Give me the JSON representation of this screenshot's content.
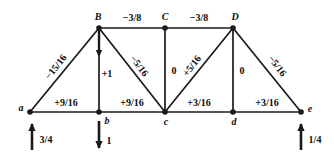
{
  "figure": {
    "type": "truss-force-diagram",
    "line_color": "#1a1a1a",
    "text_color": "#0d0d0d"
  },
  "nodes": [
    {
      "id": "a",
      "label": "a",
      "x": 30,
      "y": 112,
      "label_dx": -9,
      "label_dy": -4
    },
    {
      "id": "b",
      "label": "b",
      "x": 99,
      "y": 112,
      "label_dx": 8,
      "label_dy": 9
    },
    {
      "id": "c",
      "label": "c",
      "x": 165,
      "y": 112,
      "label_dx": 1,
      "label_dy": 10
    },
    {
      "id": "d",
      "label": "d",
      "x": 233,
      "y": 112,
      "label_dx": 1,
      "label_dy": 10
    },
    {
      "id": "e",
      "label": "e",
      "x": 301,
      "y": 112,
      "label_dx": 9,
      "label_dy": -3
    },
    {
      "id": "B",
      "label": "B",
      "x": 99,
      "y": 28,
      "label_dx": -1,
      "label_dy": -11
    },
    {
      "id": "C",
      "label": "C",
      "x": 165,
      "y": 28,
      "label_dx": 0,
      "label_dy": -11
    },
    {
      "id": "D",
      "label": "D",
      "x": 233,
      "y": 28,
      "label_dx": 2,
      "label_dy": -11
    }
  ],
  "members": [
    {
      "id": "a-B",
      "from": "a",
      "to": "B",
      "force": "−15/16",
      "label_x": 56,
      "label_y": 67,
      "rotate": -52
    },
    {
      "id": "a-b",
      "from": "a",
      "to": "b",
      "force": "+9/16",
      "label_x": 66,
      "label_y": 103,
      "rotate": 0
    },
    {
      "id": "b-B",
      "from": "b",
      "to": "B",
      "force": "+1",
      "label_x": 107,
      "label_y": 74,
      "rotate": 0
    },
    {
      "id": "B-C",
      "from": "B",
      "to": "C",
      "force": "−3/8",
      "label_x": 132,
      "label_y": 18,
      "rotate": 0
    },
    {
      "id": "B-c",
      "from": "B",
      "to": "c",
      "force": "−5/16",
      "label_x": 139,
      "label_y": 66,
      "rotate": 52
    },
    {
      "id": "b-c",
      "from": "b",
      "to": "c",
      "force": "+9/16",
      "label_x": 132,
      "label_y": 103,
      "rotate": 0
    },
    {
      "id": "C-c",
      "from": "C",
      "to": "c",
      "force": "0",
      "label_x": 174,
      "label_y": 71,
      "rotate": 0
    },
    {
      "id": "C-D",
      "from": "C",
      "to": "D",
      "force": "−3/8",
      "label_x": 199,
      "label_y": 18,
      "rotate": 0
    },
    {
      "id": "c-D",
      "from": "c",
      "to": "D",
      "force": "+5/16",
      "label_x": 192,
      "label_y": 66,
      "rotate": -52
    },
    {
      "id": "c-d",
      "from": "c",
      "to": "d",
      "force": "+3/16",
      "label_x": 199,
      "label_y": 103,
      "rotate": 0
    },
    {
      "id": "D-d",
      "from": "D",
      "to": "d",
      "force": "0",
      "label_x": 242,
      "label_y": 71,
      "rotate": 0
    },
    {
      "id": "d-e",
      "from": "d",
      "to": "e",
      "force": "+3/16",
      "label_x": 267,
      "label_y": 103,
      "rotate": 0
    },
    {
      "id": "D-e",
      "from": "D",
      "to": "e",
      "force": "−5/16",
      "label_x": 277,
      "label_y": 66,
      "rotate": 52
    }
  ],
  "loads": [
    {
      "id": "reaction-a",
      "at_node": "a",
      "label": "3/4",
      "direction": "up",
      "x": 32,
      "y_tail": 150,
      "y_head": 124,
      "label_x": 46,
      "label_y": 140
    },
    {
      "id": "applied-load-b",
      "at_node": "b",
      "label": "1",
      "direction": "down",
      "x": 99,
      "y_tail": 121,
      "y_head": 148,
      "label_x": 109,
      "label_y": 141
    },
    {
      "id": "reaction-e",
      "at_node": "e",
      "label": "1/4",
      "direction": "up",
      "x": 301,
      "y_tail": 150,
      "y_head": 124,
      "label_x": 315,
      "label_y": 140
    }
  ],
  "internal_arrow": {
    "id": "member-arrow-b-B",
    "x": 99,
    "y_tail": 31,
    "y_head": 55
  }
}
